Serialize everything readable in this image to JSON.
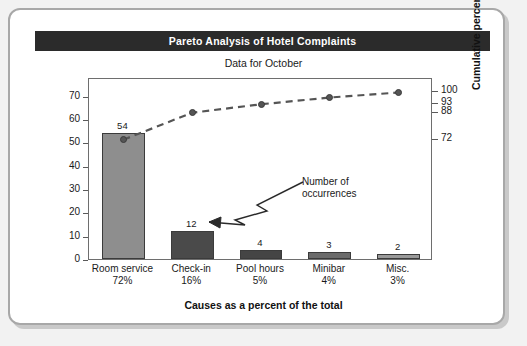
{
  "title": "Pareto Analysis of Hotel Complaints",
  "subtitle": "Data for October",
  "annotation": {
    "line1": "Number of",
    "line2": "occurrences"
  },
  "colors": {
    "title_band": "#2b2b2b",
    "title_text": "#ffffff",
    "frame": "#6e6e6e",
    "line": "#555555",
    "page_background": "#f2f2f2",
    "card_background": "#ffffff"
  },
  "chart_data": {
    "type": "bar",
    "title": "Pareto Analysis of Hotel Complaints",
    "subtitle": "Data for October",
    "xlabel": "Causes as a percent of the total",
    "ylabel": "Frequency (number)",
    "y2label": "Cumulative percent",
    "grid": false,
    "legend": "none",
    "categories": [
      "Room service",
      "Check-in",
      "Pool hours",
      "Minibar",
      "Misc."
    ],
    "category_percents": [
      "72%",
      "16%",
      "5%",
      "4%",
      "3%"
    ],
    "values": [
      54,
      12,
      4,
      3,
      2
    ],
    "bar_colors": [
      "#8e8e8e",
      "#4a4a4a",
      "#454545",
      "#6b6b6b",
      "#9a9a9a"
    ],
    "ylim": [
      0,
      78
    ],
    "yticks": [
      0,
      10,
      20,
      30,
      40,
      50,
      60,
      70
    ],
    "y2lim": [
      0,
      108
    ],
    "y2ticks": [
      72,
      88,
      93,
      100
    ],
    "series": [
      {
        "name": "Cumulative percent",
        "type": "line",
        "style": "dashed",
        "marker": "circle",
        "values": [
          72,
          88,
          93,
          97,
          100
        ]
      }
    ]
  }
}
